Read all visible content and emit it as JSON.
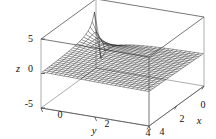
{
  "figure": {
    "kind": "3d-wireframe-surface-plot",
    "background_color": "#ffffff",
    "mesh_color": "#1a1a1a",
    "frame_color": "#555555"
  },
  "axes": {
    "z": {
      "label": "z",
      "ticks": [
        "5",
        "0",
        "-5"
      ],
      "tick_values": [
        5,
        0,
        -5
      ],
      "range": [
        -5,
        5
      ]
    },
    "y": {
      "label": "y",
      "ticks": [
        "0",
        "2",
        "4"
      ],
      "tick_values": [
        0,
        2,
        4
      ],
      "range": [
        0,
        4
      ]
    },
    "x": {
      "label": "x",
      "ticks": [
        "4",
        "2",
        "0"
      ],
      "tick_values": [
        4,
        2,
        0
      ],
      "range": [
        0,
        4
      ]
    }
  },
  "chart_data": {
    "type": "surface",
    "title": "",
    "xlabel": "x",
    "ylabel": "y",
    "zlabel": "z",
    "xlim": [
      0,
      4
    ],
    "ylim": [
      0,
      4
    ],
    "zlim": [
      -5,
      5
    ],
    "xticks": [
      0,
      2,
      4
    ],
    "yticks": [
      0,
      2,
      4
    ],
    "zticks": [
      -5,
      0,
      5
    ],
    "grid": false,
    "legend": "none",
    "view": {
      "azimuth_deg": -48,
      "elevation_deg": 22
    },
    "mesh": {
      "u_lines": 26,
      "v_lines": 26,
      "style": "wireframe",
      "shaded": false
    },
    "features": [
      "sharp vertical spike rising past z=5 near the back-left corner (small x, small y)",
      "dense saddle / bowl depression near z=0 at the left edge",
      "broad sheet sweeping down below z=-5 toward the front-right",
      "surface curving back upward at the far right edge"
    ],
    "surface_expression": "z = (x - y) / (x^2 + y^2)",
    "x_samples": [
      0.05,
      0.21,
      0.37,
      0.52,
      0.68,
      0.84,
      1.0,
      1.16,
      1.31,
      1.47,
      1.63,
      1.79,
      1.95,
      2.1,
      2.26,
      2.42,
      2.58,
      2.74,
      2.89,
      3.05,
      3.21,
      3.37,
      3.53,
      3.68,
      3.84,
      4.0
    ],
    "y_samples": [
      0.05,
      0.21,
      0.37,
      0.52,
      0.68,
      0.84,
      1.0,
      1.16,
      1.31,
      1.47,
      1.63,
      1.79,
      1.95,
      2.1,
      2.26,
      2.42,
      2.58,
      2.74,
      2.89,
      3.05,
      3.21,
      3.37,
      3.53,
      3.68,
      3.84,
      4.0
    ]
  }
}
